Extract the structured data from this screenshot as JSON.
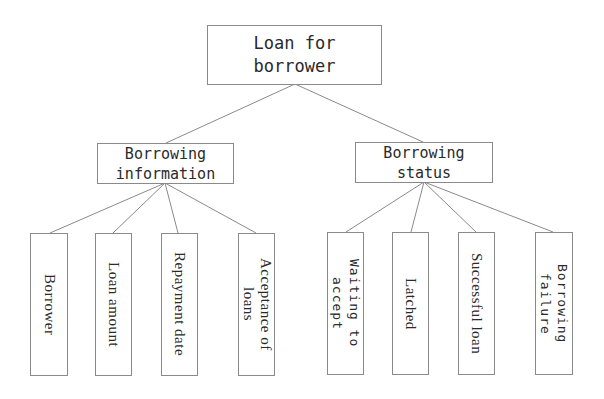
{
  "diagram": {
    "type": "tree",
    "root": {
      "label": "Loan for\nborrower"
    },
    "branches": [
      {
        "label": "Borrowing\ninformation",
        "children": [
          {
            "label": "Borrower"
          },
          {
            "label": "Loan amount"
          },
          {
            "label": "Repayment date"
          },
          {
            "label": "Acceptance of\nloans"
          }
        ]
      },
      {
        "label": "Borrowing\nstatus",
        "children": [
          {
            "label": "Waiting to\naccept"
          },
          {
            "label": "Latched"
          },
          {
            "label": "Successful loan"
          },
          {
            "label": "Borrowing\nfailure"
          }
        ]
      }
    ],
    "colors": {
      "line": "#8a8a8a",
      "border": "#8a8a8a",
      "text": "#2a2a2a",
      "background": "#ffffff"
    }
  }
}
